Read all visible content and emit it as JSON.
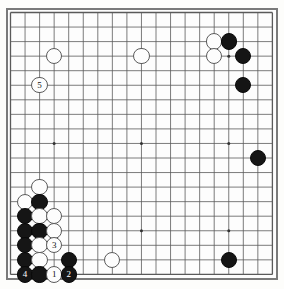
{
  "app": {
    "title": "Go Game Board Diagram",
    "board_size": 19
  },
  "board": {
    "grid_color": "#5a5a5a",
    "border_color": "#7a7a7a",
    "background_color": "#fdfdfd",
    "black_color": "#151515",
    "white_color": "#fdfdfd",
    "spacing": 14.55,
    "origin_x": 10.5,
    "origin_y": 12.5,
    "star_points": [
      {
        "col": 3,
        "row": 3
      },
      {
        "col": 9,
        "row": 3
      },
      {
        "col": 15,
        "row": 3
      },
      {
        "col": 3,
        "row": 9
      },
      {
        "col": 9,
        "row": 9
      },
      {
        "col": 15,
        "row": 9
      },
      {
        "col": 3,
        "row": 15
      },
      {
        "col": 9,
        "row": 15
      },
      {
        "col": 15,
        "row": 15
      }
    ]
  },
  "stones": [
    {
      "name": "white-stone-upper-left",
      "color": "white",
      "col": 3,
      "row": 3,
      "label": ""
    },
    {
      "name": "white-stone-marked-5",
      "color": "white",
      "col": 2,
      "row": 5,
      "label": "5"
    },
    {
      "name": "white-stone-top-center",
      "color": "white",
      "col": 9,
      "row": 3,
      "label": ""
    },
    {
      "name": "white-stone-upper-right-a",
      "color": "white",
      "col": 14,
      "row": 2,
      "label": ""
    },
    {
      "name": "white-stone-upper-right-b",
      "color": "white",
      "col": 14,
      "row": 3,
      "label": ""
    },
    {
      "name": "black-stone-upper-right-a",
      "color": "black",
      "col": 15,
      "row": 2,
      "label": ""
    },
    {
      "name": "black-stone-upper-right-b",
      "color": "black",
      "col": 16,
      "row": 3,
      "label": ""
    },
    {
      "name": "black-stone-upper-right-c",
      "color": "black",
      "col": 16,
      "row": 5,
      "label": ""
    },
    {
      "name": "black-stone-right-side",
      "color": "black",
      "col": 17,
      "row": 10,
      "label": ""
    },
    {
      "name": "black-stone-lower-right",
      "color": "black",
      "col": 15,
      "row": 17,
      "label": ""
    },
    {
      "name": "white-stone-lower-center",
      "color": "white",
      "col": 7,
      "row": 17,
      "label": ""
    },
    {
      "name": "white-stone-wall-top",
      "color": "white",
      "col": 2,
      "row": 12,
      "label": ""
    },
    {
      "name": "white-stone-wall-left",
      "color": "white",
      "col": 1,
      "row": 13,
      "label": ""
    },
    {
      "name": "black-stone-group-a",
      "color": "black",
      "col": 2,
      "row": 13,
      "label": ""
    },
    {
      "name": "black-stone-group-b",
      "color": "black",
      "col": 1,
      "row": 14,
      "label": ""
    },
    {
      "name": "white-stone-group-c",
      "color": "white",
      "col": 2,
      "row": 14,
      "label": ""
    },
    {
      "name": "white-stone-group-d",
      "color": "white",
      "col": 3,
      "row": 14,
      "label": ""
    },
    {
      "name": "black-stone-group-e",
      "color": "black",
      "col": 1,
      "row": 15,
      "label": ""
    },
    {
      "name": "black-stone-group-f",
      "color": "black",
      "col": 2,
      "row": 15,
      "label": ""
    },
    {
      "name": "white-stone-group-g",
      "color": "white",
      "col": 3,
      "row": 15,
      "label": ""
    },
    {
      "name": "black-stone-group-h",
      "color": "black",
      "col": 1,
      "row": 16,
      "label": ""
    },
    {
      "name": "white-stone-group-i",
      "color": "white",
      "col": 2,
      "row": 16,
      "label": ""
    },
    {
      "name": "white-stone-marked-3",
      "color": "white",
      "col": 3,
      "row": 16,
      "label": "3"
    },
    {
      "name": "black-stone-group-j",
      "color": "black",
      "col": 1,
      "row": 17,
      "label": ""
    },
    {
      "name": "white-stone-group-k",
      "color": "white",
      "col": 2,
      "row": 17,
      "label": ""
    },
    {
      "name": "black-stone-group-l",
      "color": "black",
      "col": 4,
      "row": 17,
      "label": ""
    },
    {
      "name": "black-stone-marked-4",
      "color": "black",
      "col": 1,
      "row": 18,
      "label": "4"
    },
    {
      "name": "black-stone-group-m",
      "color": "black",
      "col": 2,
      "row": 18,
      "label": ""
    },
    {
      "name": "white-stone-marked-1",
      "color": "white",
      "col": 3,
      "row": 18,
      "label": "1"
    },
    {
      "name": "black-stone-marked-2",
      "color": "black",
      "col": 4,
      "row": 18,
      "label": "2"
    }
  ]
}
